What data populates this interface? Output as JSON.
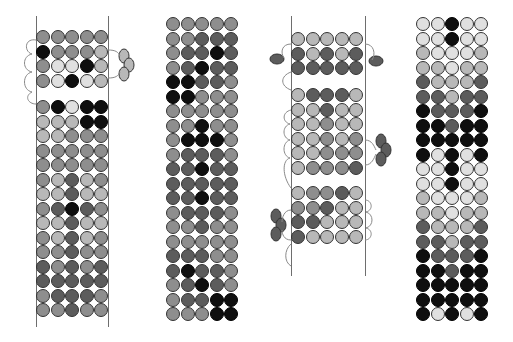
{
  "diagram": {
    "title": "",
    "legend": {
      "B": {
        "name": "black",
        "color": "#0f0f0f"
      },
      "D": {
        "name": "dark-gray",
        "color": "#5c5c5c"
      },
      "M": {
        "name": "medium-gray",
        "color": "#8e8e8e"
      },
      "L": {
        "name": "light-gray",
        "color": "#b8b8b8"
      },
      "W": {
        "name": "very-light-gray",
        "color": "#e0e0e0"
      }
    },
    "bead_pitch": 14.5,
    "panels": [
      {
        "id": "panel-1",
        "warp_left_x": 36,
        "warp_right_x": 108,
        "warp_top": 16,
        "warp_bottom": 327,
        "blocks": [
          {
            "x": 36,
            "y": 30,
            "rows": [
              "MMMMM",
              "BMMML",
              "MWWBL",
              "MWBWL"
            ]
          },
          {
            "x": 36,
            "y": 100,
            "rows": [
              "MBWBB",
              "LLLBB",
              "LLMMM",
              "MMMMM",
              "MMMMM",
              "MLDLM",
              "LLDLL",
              "MDBDM",
              "LLDLL",
              "MLDLM",
              "MMDMM",
              "DMDMD",
              "DDDDD",
              "MDDDM",
              "MMDMM"
            ]
          }
        ],
        "picots": [
          {
            "side": "right",
            "x": 124,
            "y": 65,
            "count": 3,
            "color": "#b8b8b8"
          }
        ]
      },
      {
        "id": "panel-2",
        "warp_left_x": null,
        "warp_right_x": null,
        "blocks": [
          {
            "x": 166,
            "y": 17,
            "rows": [
              "MMMMM",
              "MMDDD",
              "MDDBD",
              "MDBDD",
              "BBDDM",
              "BBMMM",
              "MMMMM",
              "MMBMM",
              "MBBBM",
              "MDDDM",
              "DDBDD",
              "DDDDD",
              "DDBDD",
              "MDDDM",
              "MMDMM",
              "MMMMM",
              "DDDMM",
              "DBDDM",
              "MDBDM",
              "MDDBB",
              "MMMBB"
            ]
          }
        ]
      },
      {
        "id": "panel-3",
        "warp_left_x": 291,
        "warp_right_x": 365,
        "warp_top": 16,
        "warp_bottom": 276,
        "blocks": [
          {
            "x": 291,
            "y": 32,
            "rows": [
              "LLLLL",
              "DLDLD",
              "DDDDD"
            ]
          },
          {
            "x": 291,
            "y": 88,
            "rows": [
              "LDDDL",
              "LLDLL",
              "LLMLL",
              "LLMLM",
              "LLMMM",
              "LMMMD"
            ]
          },
          {
            "x": 291,
            "y": 186,
            "rows": [
              "LMMDL",
              "MMDLL",
              "DDLLL",
              "DLLLL"
            ]
          }
        ],
        "picots": [
          {
            "side": "left",
            "x": 277,
            "y": 59,
            "count": 1,
            "color": "#5c5c5c"
          },
          {
            "side": "right",
            "x": 376,
            "y": 61,
            "count": 1,
            "color": "#5c5c5c"
          },
          {
            "side": "right",
            "x": 381,
            "y": 150,
            "count": 3,
            "color": "#5c5c5c"
          },
          {
            "side": "left",
            "x": 276,
            "y": 225,
            "count": 3,
            "color": "#5c5c5c"
          }
        ]
      },
      {
        "id": "panel-4",
        "blocks": [
          {
            "x": 416,
            "y": 17,
            "rows": [
              "WWBWW",
              "WWBWW",
              "LWWWL",
              "LLWLL",
              "DLLLD",
              "DDLDD",
              "BDDDB",
              "BBDBB",
              "BBBBB",
              "BWBWB",
              "WWBWW",
              "WWBWW",
              "LWWWL",
              "LLWLL",
              "DLLLD",
              "DDLDD",
              "BDDDB",
              "BBDBB",
              "BBBBB",
              "BBBBB",
              "BWBWB"
            ]
          }
        ]
      }
    ]
  }
}
